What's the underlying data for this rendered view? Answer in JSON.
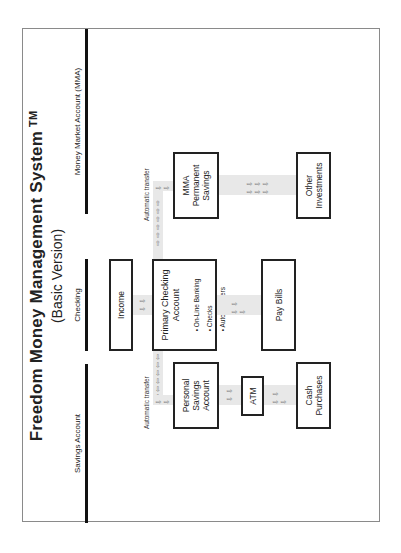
{
  "title": "Freedom Money Management System",
  "trademark": "TM",
  "subtitle": "(Basic Version)",
  "columns": [
    {
      "label": "Savings Account"
    },
    {
      "label": "Checking"
    },
    {
      "label": "Money Market Account  (MMA)"
    }
  ],
  "nodes": {
    "income": "Income",
    "primary_checking": {
      "title_line1": "Primary Checking",
      "title_line2": "Account",
      "bullets": [
        "On-Line Banking",
        "Checks",
        "Auto transfers"
      ]
    },
    "pay_bills": "Pay Bills",
    "personal_savings": {
      "line1": "Personal",
      "line2": "Savings",
      "line3": "Account"
    },
    "atm": "ATM",
    "cash_purchases": {
      "line1": "Cash",
      "line2": "Purchases"
    },
    "mma_savings": {
      "line1": "MMA",
      "line2": "Permanent",
      "line3": "Savings"
    },
    "other_investments": {
      "line1": "Other",
      "line2": "Investments"
    }
  },
  "flow_labels": {
    "left_transfer": "Automatic transfer",
    "right_transfer": "Automatic transfer"
  },
  "arrows": {
    "down": "⇩ ⇩",
    "down3": "⇩ ⇩ ⇩",
    "down6": "⇩ ⇩ ⇩ ⇩ ⇩ ⇩",
    "left": "⇦ ⇦ ⇦ ⇦ ⇦ ⇦",
    "right": "⇨ ⇨ ⇨ ⇨ ⇨ ⇨",
    "bullet": "•"
  }
}
